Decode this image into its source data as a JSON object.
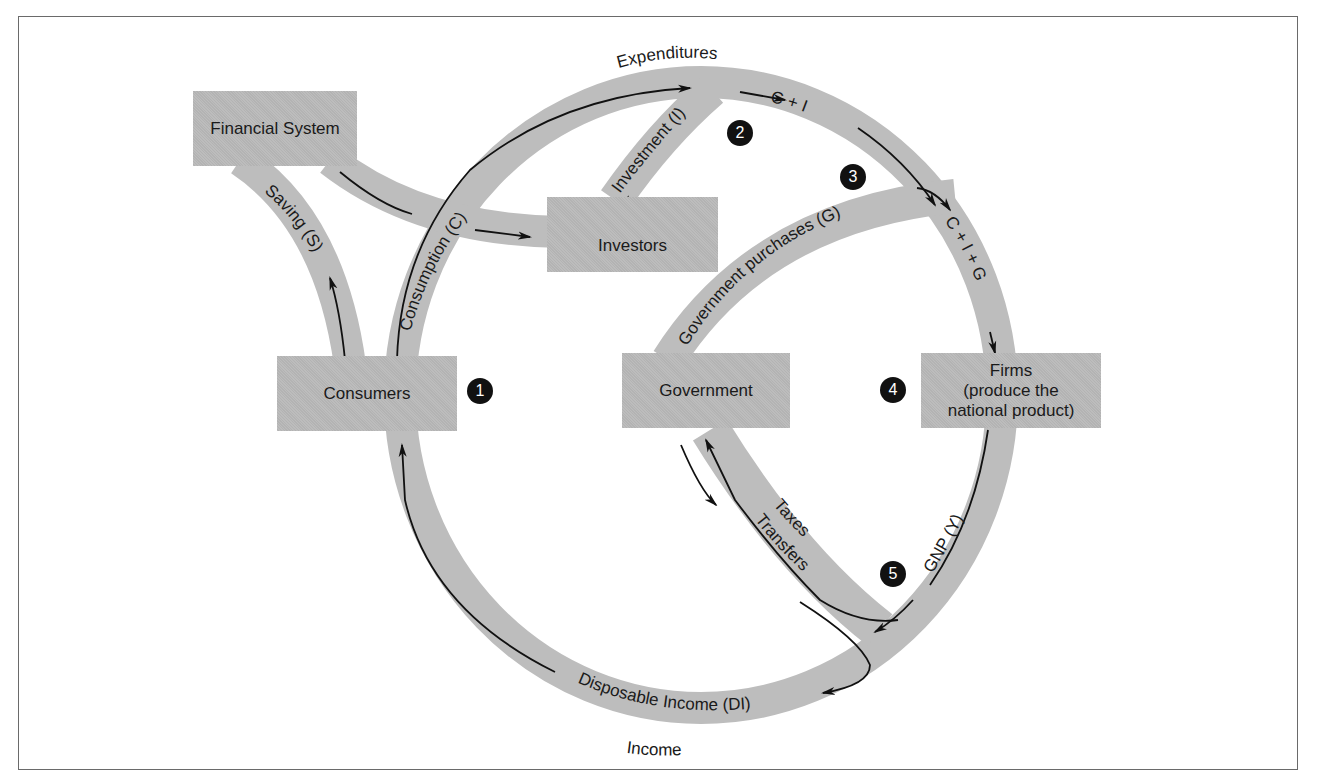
{
  "diagram": {
    "title_top": "Expenditures",
    "title_bottom": "Income",
    "colors": {
      "band": "#bdbdbd",
      "box": "#b9b9b9",
      "arrow": "#111111",
      "badge": "#111111",
      "frame": "#6a6a6a"
    },
    "nodes": {
      "financial_system": "Financial System",
      "investors": "Investors",
      "consumers": "Consumers",
      "government": "Government",
      "firms_line1": "Firms",
      "firms_line2": "(produce the",
      "firms_line3": "national product)"
    },
    "flows": {
      "saving": "Saving (S)",
      "consumption": "Consumption (C)",
      "investment": "Investment (I)",
      "c_plus_i": "C + I",
      "government_purchases": "Government purchases (G)",
      "c_plus_i_plus_g": "C + I + G",
      "gnp": "GNP (Y)",
      "taxes": "Taxes",
      "transfers": "Transfers",
      "disposable_income": "Disposable Income (DI)"
    },
    "badges": [
      "1",
      "2",
      "3",
      "4",
      "5"
    ]
  }
}
